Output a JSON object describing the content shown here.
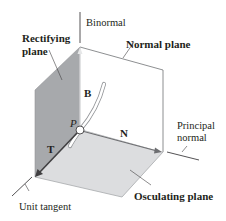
{
  "diagram": {
    "labels": {
      "binormal": "Binormal",
      "rectifying_plane_line1": "Rectifying",
      "rectifying_plane_line2": "plane",
      "normal_plane": "Normal plane",
      "principal_normal_line1": "Principal",
      "principal_normal_line2": "normal",
      "osculating_plane": "Osculating plane",
      "unit_tangent": "Unit tangent",
      "vector_B": "B",
      "vector_N": "N",
      "vector_T": "T",
      "point_P": "P"
    },
    "colors": {
      "rectifying_plane": "#a7a9ac",
      "osculating_plane": "#dcdddf",
      "normal_plane": "#ffffff",
      "edge": "#808285",
      "arrow": "#414042",
      "text": "#231f20"
    }
  }
}
